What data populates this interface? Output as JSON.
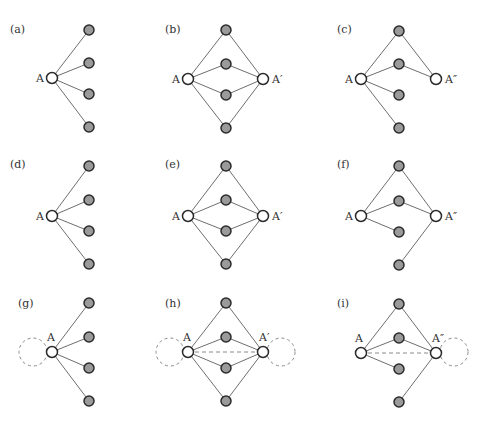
{
  "figure": {
    "colors": {
      "edge": "#6e6e6e",
      "filled_node": "#9a9a9a",
      "open_node": "#ffffff",
      "node_stroke": "#2a2a2a",
      "dashed": "#8a8a8a"
    },
    "panels": [
      {
        "id": "a",
        "label": "(a)",
        "label_pos": [
          10,
          33
        ],
        "nodes": [
          {
            "id": "A",
            "type": "open",
            "x": 52,
            "y": 78,
            "label": "A",
            "label_pos": [
              36,
              82
            ]
          },
          {
            "id": "n1",
            "type": "filled",
            "x": 89,
            "y": 30
          },
          {
            "id": "n2",
            "type": "filled",
            "x": 89,
            "y": 63
          },
          {
            "id": "n3",
            "type": "filled",
            "x": 89,
            "y": 94
          },
          {
            "id": "n4",
            "type": "filled",
            "x": 89,
            "y": 127
          }
        ],
        "edges": [
          [
            "A",
            "n1"
          ],
          [
            "A",
            "n2"
          ],
          [
            "A",
            "n3"
          ],
          [
            "A",
            "n4"
          ]
        ],
        "dashed_edges": [],
        "loops": []
      },
      {
        "id": "b",
        "label": "(b)",
        "label_pos": [
          165,
          33
        ],
        "nodes": [
          {
            "id": "A",
            "type": "open",
            "x": 188,
            "y": 79,
            "label": "A",
            "label_pos": [
              172,
              83
            ]
          },
          {
            "id": "A2",
            "type": "open",
            "x": 263,
            "y": 79,
            "label": "A′",
            "label_pos": [
              272,
              83
            ]
          },
          {
            "id": "n1",
            "type": "filled",
            "x": 226,
            "y": 30
          },
          {
            "id": "n2",
            "type": "filled",
            "x": 226,
            "y": 64
          },
          {
            "id": "n3",
            "type": "filled",
            "x": 226,
            "y": 95
          },
          {
            "id": "n4",
            "type": "filled",
            "x": 226,
            "y": 128
          }
        ],
        "edges": [
          [
            "A",
            "n1"
          ],
          [
            "A",
            "n2"
          ],
          [
            "A",
            "n3"
          ],
          [
            "A",
            "n4"
          ],
          [
            "A2",
            "n1"
          ],
          [
            "A2",
            "n2"
          ],
          [
            "A2",
            "n3"
          ],
          [
            "A2",
            "n4"
          ]
        ],
        "dashed_edges": [],
        "loops": []
      },
      {
        "id": "c",
        "label": "(c)",
        "label_pos": [
          337,
          33
        ],
        "nodes": [
          {
            "id": "A",
            "type": "open",
            "x": 361,
            "y": 79,
            "label": "A",
            "label_pos": [
              345,
              83
            ]
          },
          {
            "id": "A3",
            "type": "open",
            "x": 436,
            "y": 79,
            "label": "A″",
            "label_pos": [
              445,
              83
            ]
          },
          {
            "id": "n1",
            "type": "filled",
            "x": 399,
            "y": 31
          },
          {
            "id": "n2",
            "type": "filled",
            "x": 399,
            "y": 64
          },
          {
            "id": "n3",
            "type": "filled",
            "x": 399,
            "y": 95
          },
          {
            "id": "n4",
            "type": "filled",
            "x": 399,
            "y": 128
          }
        ],
        "edges": [
          [
            "A",
            "n1"
          ],
          [
            "A",
            "n2"
          ],
          [
            "A",
            "n3"
          ],
          [
            "A",
            "n4"
          ],
          [
            "A3",
            "n1"
          ],
          [
            "A3",
            "n2"
          ]
        ],
        "dashed_edges": [],
        "loops": []
      },
      {
        "id": "d",
        "label": "(d)",
        "label_pos": [
          10,
          168
        ],
        "nodes": [
          {
            "id": "A",
            "type": "open",
            "x": 52,
            "y": 216,
            "label": "A",
            "label_pos": [
              36,
              220
            ]
          },
          {
            "id": "n1",
            "type": "filled",
            "x": 89,
            "y": 166
          },
          {
            "id": "n2",
            "type": "filled",
            "x": 89,
            "y": 200
          },
          {
            "id": "n3",
            "type": "filled",
            "x": 89,
            "y": 231
          },
          {
            "id": "n4",
            "type": "filled",
            "x": 89,
            "y": 264
          }
        ],
        "edges": [
          [
            "A",
            "n1"
          ],
          [
            "A",
            "n2"
          ],
          [
            "A",
            "n3"
          ],
          [
            "A",
            "n4"
          ]
        ],
        "dashed_edges": [],
        "loops": []
      },
      {
        "id": "e",
        "label": "(e)",
        "label_pos": [
          165,
          168
        ],
        "nodes": [
          {
            "id": "A",
            "type": "open",
            "x": 188,
            "y": 216,
            "label": "A",
            "label_pos": [
              172,
              220
            ]
          },
          {
            "id": "A2",
            "type": "open",
            "x": 263,
            "y": 216,
            "label": "A′",
            "label_pos": [
              272,
              220
            ]
          },
          {
            "id": "n1",
            "type": "filled",
            "x": 226,
            "y": 166
          },
          {
            "id": "n2",
            "type": "filled",
            "x": 226,
            "y": 200
          },
          {
            "id": "n3",
            "type": "filled",
            "x": 226,
            "y": 231
          },
          {
            "id": "n4",
            "type": "filled",
            "x": 226,
            "y": 264
          }
        ],
        "edges": [
          [
            "A",
            "n1"
          ],
          [
            "A",
            "n2"
          ],
          [
            "A",
            "n3"
          ],
          [
            "A",
            "n4"
          ],
          [
            "A2",
            "n1"
          ],
          [
            "A2",
            "n2"
          ],
          [
            "A2",
            "n3"
          ],
          [
            "A2",
            "n4"
          ]
        ],
        "dashed_edges": [],
        "loops": []
      },
      {
        "id": "f",
        "label": "(f)",
        "label_pos": [
          337,
          168
        ],
        "nodes": [
          {
            "id": "A",
            "type": "open",
            "x": 361,
            "y": 216,
            "label": "A",
            "label_pos": [
              345,
              220
            ]
          },
          {
            "id": "A3",
            "type": "open",
            "x": 436,
            "y": 216,
            "label": "A″",
            "label_pos": [
              445,
              220
            ]
          },
          {
            "id": "n1",
            "type": "filled",
            "x": 399,
            "y": 166
          },
          {
            "id": "n2",
            "type": "filled",
            "x": 399,
            "y": 201
          },
          {
            "id": "n3",
            "type": "filled",
            "x": 399,
            "y": 232
          },
          {
            "id": "n4",
            "type": "filled",
            "x": 399,
            "y": 265
          }
        ],
        "edges": [
          [
            "A",
            "n1"
          ],
          [
            "A",
            "n2"
          ],
          [
            "A",
            "n3"
          ],
          [
            "A3",
            "n1"
          ],
          [
            "A3",
            "n2"
          ],
          [
            "A3",
            "n4"
          ]
        ],
        "dashed_edges": [],
        "loops": []
      },
      {
        "id": "g",
        "label": "(g)",
        "label_pos": [
          18,
          307
        ],
        "nodes": [
          {
            "id": "A",
            "type": "open",
            "x": 52,
            "y": 352,
            "label": "A",
            "label_pos": [
              47,
              341
            ]
          },
          {
            "id": "n1",
            "type": "filled",
            "x": 89,
            "y": 303
          },
          {
            "id": "n2",
            "type": "filled",
            "x": 89,
            "y": 337
          },
          {
            "id": "n3",
            "type": "filled",
            "x": 89,
            "y": 368
          },
          {
            "id": "n4",
            "type": "filled",
            "x": 89,
            "y": 401
          }
        ],
        "edges": [
          [
            "A",
            "n1"
          ],
          [
            "A",
            "n2"
          ],
          [
            "A",
            "n3"
          ],
          [
            "A",
            "n4"
          ]
        ],
        "dashed_edges": [],
        "loops": [
          {
            "cx": 33,
            "cy": 352,
            "r": 14
          }
        ]
      },
      {
        "id": "h",
        "label": "(h)",
        "label_pos": [
          165,
          307
        ],
        "nodes": [
          {
            "id": "A",
            "type": "open",
            "x": 188,
            "y": 352,
            "label": "A",
            "label_pos": [
              183,
              341
            ]
          },
          {
            "id": "A2",
            "type": "open",
            "x": 263,
            "y": 352,
            "label": "A′",
            "label_pos": [
              259,
              341
            ]
          },
          {
            "id": "n1",
            "type": "filled",
            "x": 226,
            "y": 303
          },
          {
            "id": "n2",
            "type": "filled",
            "x": 226,
            "y": 337
          },
          {
            "id": "n3",
            "type": "filled",
            "x": 226,
            "y": 368
          },
          {
            "id": "n4",
            "type": "filled",
            "x": 226,
            "y": 401
          }
        ],
        "edges": [
          [
            "A",
            "n1"
          ],
          [
            "A",
            "n2"
          ],
          [
            "A",
            "n3"
          ],
          [
            "A",
            "n4"
          ],
          [
            "A2",
            "n1"
          ],
          [
            "A2",
            "n2"
          ],
          [
            "A2",
            "n3"
          ],
          [
            "A2",
            "n4"
          ]
        ],
        "dashed_edges": [
          [
            "A",
            "A2"
          ]
        ],
        "loops": [
          {
            "cx": 170,
            "cy": 352,
            "r": 14
          },
          {
            "cx": 281,
            "cy": 352,
            "r": 14
          }
        ]
      },
      {
        "id": "i",
        "label": "(i)",
        "label_pos": [
          337,
          307
        ],
        "nodes": [
          {
            "id": "A",
            "type": "open",
            "x": 361,
            "y": 353,
            "label": "A",
            "label_pos": [
              355,
              342
            ]
          },
          {
            "id": "A3",
            "type": "open",
            "x": 436,
            "y": 353,
            "label": "A″",
            "label_pos": [
              432,
              342
            ]
          },
          {
            "id": "n1",
            "type": "filled",
            "x": 399,
            "y": 304
          },
          {
            "id": "n2",
            "type": "filled",
            "x": 399,
            "y": 338
          },
          {
            "id": "n3",
            "type": "filled",
            "x": 399,
            "y": 369
          },
          {
            "id": "n4",
            "type": "filled",
            "x": 399,
            "y": 402
          }
        ],
        "edges": [
          [
            "A",
            "n1"
          ],
          [
            "A",
            "n2"
          ],
          [
            "A",
            "n3"
          ],
          [
            "A3",
            "n1"
          ],
          [
            "A3",
            "n2"
          ],
          [
            "A3",
            "n4"
          ]
        ],
        "dashed_edges": [
          [
            "A",
            "A3"
          ]
        ],
        "loops": [
          {
            "cx": 454,
            "cy": 352,
            "r": 14
          }
        ]
      }
    ]
  }
}
